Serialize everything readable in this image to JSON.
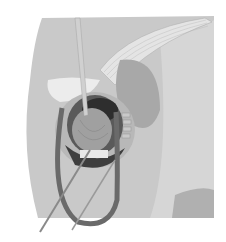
{
  "illustration": {
    "subject": "surgical-exposure-illustration",
    "style": "grayscale",
    "colors": {
      "background": "#ffffff",
      "skin_light": "#d8d8d8",
      "skin_mid": "#bdbdbd",
      "skin_dark": "#9a9a9a",
      "muscle": "#8e8e8e",
      "cavity": "#3a3a3a",
      "retractor": "#6e6e6e",
      "instrument": "#cfcfcf"
    }
  }
}
